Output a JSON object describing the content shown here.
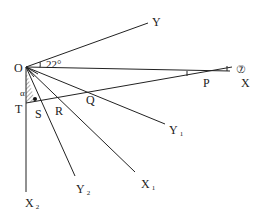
{
  "diagram": {
    "origin": {
      "label": "O",
      "x": 26,
      "y": 67
    },
    "angle_label": "22°",
    "rays": [
      {
        "name": "Y",
        "label": "Y",
        "sub": "",
        "end": [
          148,
          23
        ],
        "lx": 152,
        "ly": 26
      },
      {
        "name": "X",
        "label": "X",
        "sub": "",
        "end": [
          230,
          71
        ],
        "lx": 241,
        "ly": 87
      },
      {
        "name": "Y1",
        "label": "Y",
        "sub": "1",
        "end": [
          165,
          124
        ],
        "lx": 169,
        "ly": 134
      },
      {
        "name": "X1",
        "label": "X",
        "sub": "1",
        "end": [
          135,
          172
        ],
        "lx": 141,
        "ly": 188
      },
      {
        "name": "Y2",
        "label": "Y",
        "sub": "2",
        "end": [
          75,
          176
        ],
        "lx": 76,
        "ly": 193
      },
      {
        "name": "X2",
        "label": "X",
        "sub": "2",
        "end": [
          26,
          192
        ],
        "lx": 25,
        "ly": 207
      }
    ],
    "points": [
      {
        "label": "P",
        "lx": 203,
        "ly": 87
      },
      {
        "label": "Q",
        "lx": 86,
        "ly": 104
      },
      {
        "label": "R",
        "lx": 55,
        "ly": 115
      },
      {
        "label": "S",
        "lx": 35,
        "ly": 118
      },
      {
        "label": "T",
        "lx": 15,
        "ly": 113
      }
    ],
    "transversal": {
      "from": [
        26,
        103
      ],
      "to": [
        232,
        67
      ]
    },
    "small_angle_mark": "α",
    "circled_number": "⑦"
  }
}
